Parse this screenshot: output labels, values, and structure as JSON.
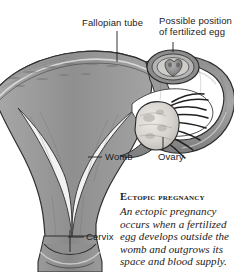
{
  "figure": {
    "background_color": "#ffffff",
    "ink_color": "#1d1d1d"
  },
  "labels": {
    "fallopian_tube": "Fallopian tube",
    "possible_position": "Possible position\nof fertilized egg",
    "womb": "Womb",
    "ovary": "Ovary",
    "cervix": "Cervix"
  },
  "caption": {
    "heading": "Ectopic pregnancy",
    "body": "An ectopic pregnancy occurs when a fertilized egg develops outside the womb and outgrows its space and blood supply."
  },
  "illustration": {
    "palette": {
      "tissue_mid": "#9a9a9a",
      "tissue_light": "#b9b9b9",
      "tissue_dark": "#6f6f6f",
      "outline": "#2b2b2b",
      "cavity": "#ffffff",
      "ovary_fill": "#d8d6d2",
      "embryo_fill": "#8b8b8b"
    },
    "parts": [
      "uterus-body",
      "uterine-cavity",
      "fallopian-tube",
      "ovary",
      "fimbriae",
      "fertilized-egg",
      "cervix",
      "vaginal-canal"
    ]
  }
}
